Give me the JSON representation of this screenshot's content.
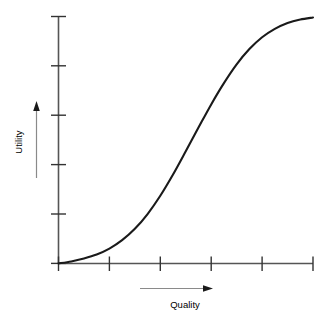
{
  "chart_data": {
    "type": "line",
    "title": "",
    "xlabel": "Quality",
    "ylabel": "Utility",
    "grid": false,
    "legend": null,
    "annotations": [
      {
        "name": "x-axis-arrow",
        "direction": "right",
        "meaning": "increasing quality"
      },
      {
        "name": "y-axis-arrow",
        "direction": "up",
        "meaning": "increasing utility"
      }
    ],
    "axes": {
      "x": {
        "label": "Quality",
        "tick_labels": [
          "",
          "",
          "",
          "",
          "",
          ""
        ],
        "tick_count": 6,
        "range": [
          0,
          5
        ],
        "ticks": [
          0,
          1,
          2,
          3,
          4,
          5
        ]
      },
      "y": {
        "label": "Utility",
        "tick_labels": [
          "",
          "",
          "",
          "",
          "",
          ""
        ],
        "tick_count": 6,
        "range": [
          0,
          5
        ],
        "ticks": [
          0,
          1,
          2,
          3,
          4,
          5
        ]
      }
    },
    "series": [
      {
        "name": "utility-curve",
        "shape": "sigmoid",
        "color": "#1a1a1a",
        "x": [
          0.0,
          0.25,
          0.5,
          0.75,
          1.0,
          1.25,
          1.5,
          1.75,
          2.0,
          2.25,
          2.5,
          2.75,
          3.0,
          3.25,
          3.5,
          3.75,
          4.0,
          4.25,
          4.5,
          4.75,
          5.0
        ],
        "y": [
          0.0,
          0.04,
          0.1,
          0.18,
          0.3,
          0.47,
          0.7,
          1.0,
          1.37,
          1.8,
          2.27,
          2.75,
          3.22,
          3.65,
          4.03,
          4.34,
          4.58,
          4.75,
          4.87,
          4.94,
          4.98
        ]
      }
    ]
  },
  "labels": {
    "x_axis": "Quality",
    "y_axis": "Utility"
  },
  "colors": {
    "curve": "#1a1a1a",
    "axis": "#555555",
    "tick": "#333333",
    "arrow": "#777777",
    "text": "#000000",
    "background": "#ffffff"
  }
}
